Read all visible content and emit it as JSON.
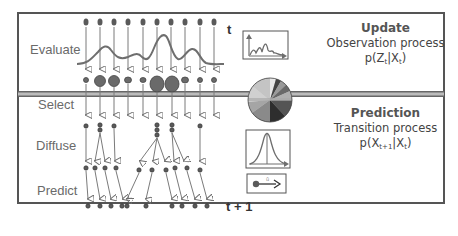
{
  "stages": {
    "evaluate": "Evaluate",
    "select": "Select",
    "diffuse": "Diffuse",
    "predict": "Predict"
  },
  "time": {
    "current": "t",
    "next": "t + 1"
  },
  "update_panel": {
    "title": "Update",
    "subtitle": "Observation process",
    "formula_prefix": "p(Z",
    "formula_sub1": "t",
    "formula_mid": "|X",
    "formula_sub2": "t",
    "formula_suffix": ")"
  },
  "prediction_panel": {
    "title": "Prediction",
    "subtitle": "Transition process",
    "formula_prefix": "p(X",
    "formula_sub1": "t+1",
    "formula_mid": "|X",
    "formula_sub2": "t",
    "formula_suffix": ")"
  },
  "icons": {
    "likelihood_plot": "likelihood-graph-icon",
    "weights_pie": "pie-chart-icon",
    "gaussian": "gaussian-curve-icon",
    "motion": "particle-motion-icon"
  },
  "colors": {
    "particle": "#5a5a5a",
    "arrow": "#7a7a7a",
    "curve": "#6e6e6e",
    "frame": "#555555"
  },
  "particles": {
    "count": 10,
    "weighted_sizes": [
      "small",
      "large",
      "large",
      "medium",
      "medium",
      "xlarge",
      "xlarge",
      "medium",
      "small",
      "small"
    ]
  }
}
